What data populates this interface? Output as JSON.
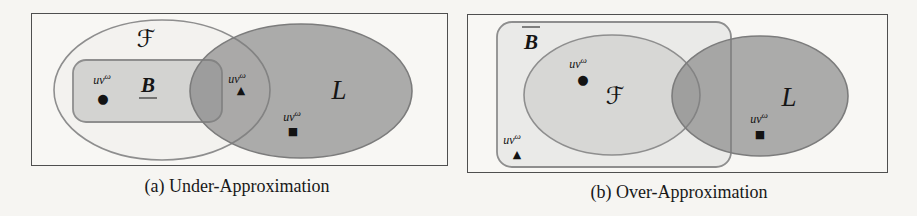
{
  "figure_type": "venn-diagram-figure",
  "colors": {
    "page_background": "#f6f5f2",
    "panel_background": "#f8f7f4",
    "panel_border": "#4f4f4f",
    "set_outline": "#8e8e8e",
    "l_outline": "#7c7c7c",
    "f_fill_a": "#f3f2ef",
    "b_fill_a": "#d3d3d1",
    "bbar_fill_b": "#eaeae8",
    "f_fill_b": "#d7d7d5",
    "l_fill": "rgba(125,125,125,0.62)",
    "marker_color": "#131313"
  },
  "panels": [
    {
      "id": "a",
      "caption": "(a) Under-Approximation",
      "f_label": "ℱ",
      "b_label": "B",
      "b_decoration": "underline",
      "l_label": "L",
      "points": [
        {
          "region": "inside B",
          "base": "uv",
          "sup": "ω",
          "glyph": "●"
        },
        {
          "region": "in F and L, outside B",
          "base": "uv",
          "sup": "ω",
          "glyph": "▲"
        },
        {
          "region": "inside L only",
          "base": "uv",
          "sup": "ω",
          "glyph": "■"
        }
      ]
    },
    {
      "id": "b",
      "caption": "(b) Over-Approximation",
      "b_label": "B",
      "b_decoration": "overline",
      "f_label": "ℱ",
      "l_label": "L",
      "points": [
        {
          "region": "inside F",
          "base": "uv",
          "sup": "ω",
          "glyph": "●"
        },
        {
          "region": "in B-bar, outside F",
          "base": "uv",
          "sup": "ω",
          "glyph": "▲"
        },
        {
          "region": "inside L only",
          "base": "uv",
          "sup": "ω",
          "glyph": "■"
        }
      ]
    }
  ]
}
